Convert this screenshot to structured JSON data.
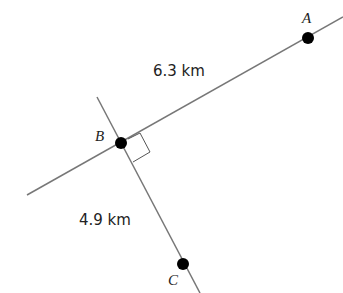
{
  "points": {
    "A": {
      "label": "A",
      "x": 308,
      "y": 38
    },
    "B": {
      "label": "B",
      "x": 121,
      "y": 143
    },
    "C": {
      "label": "C",
      "x": 183,
      "y": 264
    }
  },
  "distances": {
    "AB": "6.3 km",
    "BC": "4.9 km"
  },
  "colors": {
    "line": "#777777",
    "dot": "#000000"
  }
}
